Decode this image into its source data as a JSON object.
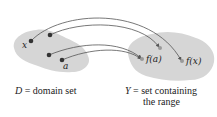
{
  "diagram": {
    "domain_set": {
      "label_symbol": "D",
      "label_text": "= domain set",
      "points": [
        {
          "id": "x",
          "label": "x"
        },
        {
          "id": "p2",
          "label": ""
        },
        {
          "id": "p3",
          "label": ""
        },
        {
          "id": "a",
          "label": "a"
        }
      ]
    },
    "codomain_set": {
      "label_symbol": "Y",
      "label_text_line1": "= set containing",
      "label_text_line2": "the range",
      "points": [
        {
          "id": "fa",
          "label": "f(a)"
        },
        {
          "id": "fx",
          "label": "f(x)"
        },
        {
          "id": "q3",
          "label": ""
        }
      ]
    },
    "mappings": [
      {
        "from": "x",
        "to": "f(x)"
      },
      {
        "from": "p2",
        "to": "q3"
      },
      {
        "from": "p3",
        "to": "f(a)"
      },
      {
        "from": "a",
        "to": "f(a)"
      }
    ],
    "colors": {
      "blob": "#d4d4d4",
      "domain_dot": "#333333",
      "range_dot": "#9a9a9a",
      "arrow": "#555555"
    }
  }
}
